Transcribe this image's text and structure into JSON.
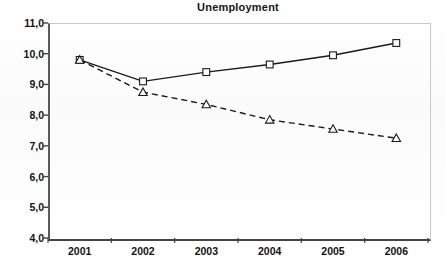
{
  "chart_data": {
    "type": "line",
    "title": "Unemployment",
    "xlabel": "",
    "ylabel": "",
    "categories": [
      "2001",
      "2002",
      "2003",
      "2004",
      "2005",
      "2006"
    ],
    "ylim": [
      4.0,
      11.0
    ],
    "ytick_step": 1.0,
    "ytick_labels": [
      "11,0",
      "10,0",
      "9,0",
      "8,0",
      "7,0",
      "6,0",
      "5,0",
      "4,0"
    ],
    "ytick_values": [
      11.0,
      10.0,
      9.0,
      8.0,
      7.0,
      6.0,
      5.0,
      4.0
    ],
    "decimal_separator": ",",
    "grid": false,
    "legend": "none",
    "series": [
      {
        "name": "series-solid-square",
        "line_style": "solid",
        "marker": "square-open",
        "color": "#1a1a1a",
        "values": [
          9.8,
          9.1,
          9.4,
          9.65,
          9.95,
          10.35
        ]
      },
      {
        "name": "series-dashed-triangle",
        "line_style": "dashed",
        "marker": "triangle-open",
        "color": "#1a1a1a",
        "values": [
          9.8,
          8.75,
          8.35,
          7.85,
          7.55,
          7.25
        ]
      }
    ]
  },
  "style": {
    "axis_color": "#444444",
    "plot_border_color": "#c9c9c9",
    "text_color": "#131313",
    "background": "#ffffff"
  }
}
